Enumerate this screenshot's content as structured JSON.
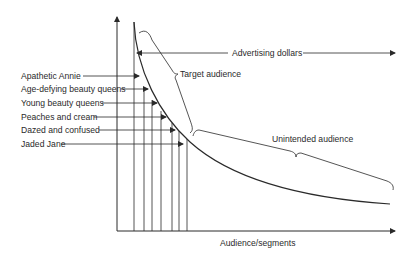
{
  "diagram": {
    "title": "",
    "colors": {
      "ink": "#2a2a2a",
      "background": "#ffffff"
    },
    "axes": {
      "x_label": "Audience/segments",
      "y_label": ""
    },
    "annotations": {
      "advertising_dollars": "Advertising dollars",
      "target_audience": "Target audience",
      "unintended_audience": "Unintended audience"
    },
    "segments": [
      {
        "label": "Apathetic Annie"
      },
      {
        "label": "Age-defying beauty queens"
      },
      {
        "label": "Young beauty queens"
      },
      {
        "label": "Peaches and cream"
      },
      {
        "label": "Dazed and confused"
      },
      {
        "label": "Jaded Jane"
      }
    ]
  }
}
